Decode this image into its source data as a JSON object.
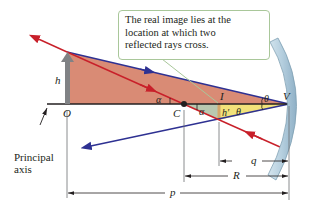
{
  "callout": {
    "lines": [
      "The real image lies at the",
      "location at which two",
      "reflected rays cross."
    ]
  },
  "labels": {
    "object_height": "h",
    "object_point": "O",
    "center_of_curvature": "C",
    "image_point": "I",
    "vertex": "V",
    "image_height": "h′",
    "alpha_upper": "α",
    "alpha_lower": "α",
    "theta_upper": "θ",
    "theta_lower": "θ",
    "image_distance": "q",
    "radius": "R",
    "object_distance": "p",
    "principal_axis": [
      "Principal",
      "axis"
    ]
  },
  "colors": {
    "upper_triangle_fill": "#d98b75",
    "lower_left_fill": "#b9c8b0",
    "lower_right_fill": "#f2e27a",
    "red_ray": "#c8202a",
    "blue_ray": "#2e3192",
    "mirror": "#b9d3e3",
    "object_arrow": "#808285",
    "callout_border": "#a9c79a",
    "axis": "#231f20"
  }
}
